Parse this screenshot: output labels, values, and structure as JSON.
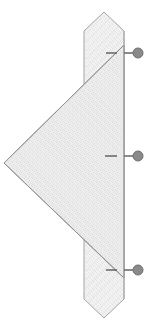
{
  "canvas": {
    "width": 151,
    "height": 332,
    "background": "#ffffff",
    "title": "Structural Section Detail"
  },
  "style": {
    "fill_light": "#f2f2f2",
    "fill_hatch": "#e4e4e4",
    "fill_triangle": "#ededed",
    "stroke_outline": "#9a9a9a",
    "stroke_outline_dark": "#808080",
    "marker_fill": "#8a8a8a",
    "marker_stroke": "#6e6e6e",
    "leader_line": "#6e6e6e",
    "tick_mark": "#5a5a5a"
  },
  "shapes": {
    "vertical_member": {
      "label": "vertical-post-member",
      "points": "104,12 124,31 124,299 104,318 84,299 84,31",
      "fill": "#f4f4f4"
    },
    "triangle_member": {
      "label": "triangular-gusset-plate",
      "points": "124,45 124,278 4,163",
      "fill": "#ededed"
    }
  },
  "markers": [
    {
      "name": "annotation-marker-top",
      "cx": 138,
      "cy": 53,
      "r": 5,
      "leader_x1": 124,
      "leader_x2": 133,
      "tick_x1": 106,
      "tick_x2": 117,
      "tick_y": 53
    },
    {
      "name": "annotation-marker-middle",
      "cx": 138,
      "cy": 156,
      "r": 5,
      "leader_x1": 124,
      "leader_x2": 133,
      "tick_x1": 105,
      "tick_x2": 117,
      "tick_y": 156
    },
    {
      "name": "annotation-marker-bottom",
      "cx": 138,
      "cy": 270,
      "r": 5,
      "leader_x1": 124,
      "leader_x2": 133,
      "tick_x1": 106,
      "tick_x2": 117,
      "tick_y": 270
    }
  ],
  "labels": {
    "marker_top": "",
    "marker_middle": "",
    "marker_bottom": ""
  }
}
